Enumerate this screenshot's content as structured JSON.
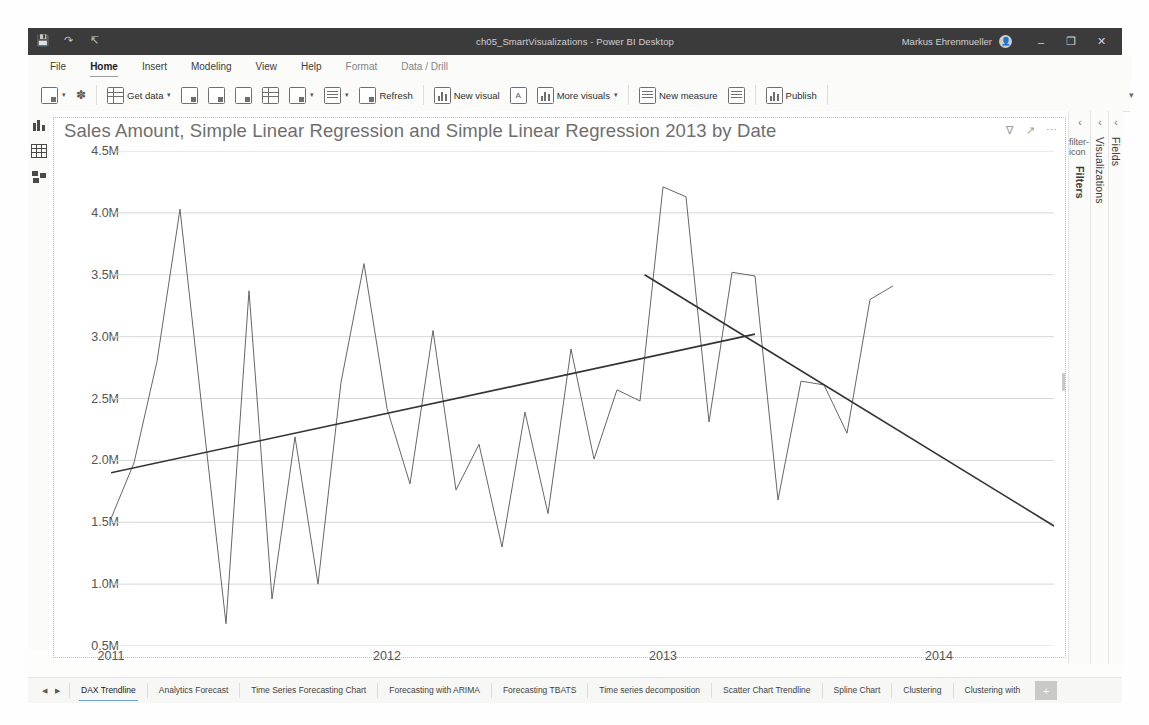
{
  "window": {
    "title": "ch05_SmartVisualizations - Power BI Desktop",
    "user": "Markus Ehrenmueller",
    "avatar_initial": "",
    "quick_access": [
      "save-icon",
      "undo-icon",
      "redo-icon"
    ],
    "controls": {
      "minimize": "–",
      "maximize": "❐",
      "close": "✕"
    }
  },
  "menubar": {
    "items": [
      {
        "label": "File",
        "active": false,
        "dim": false
      },
      {
        "label": "Home",
        "active": true,
        "dim": false
      },
      {
        "label": "Insert",
        "active": false,
        "dim": false
      },
      {
        "label": "Modeling",
        "active": false,
        "dim": false
      },
      {
        "label": "View",
        "active": false,
        "dim": false
      },
      {
        "label": "Help",
        "active": false,
        "dim": false
      },
      {
        "label": "Format",
        "active": false,
        "dim": true
      },
      {
        "label": "Data / Drill",
        "active": false,
        "dim": true
      }
    ]
  },
  "ribbon": {
    "collapse_icon": "chevron-down-icon",
    "items": [
      {
        "label": "",
        "icon": "paste-icon",
        "caret": true
      },
      {
        "label": "",
        "icon": "format-painter-icon",
        "caret": false
      },
      {
        "sep": true
      },
      {
        "label": "Get data",
        "icon": "get-data-icon",
        "caret": true
      },
      {
        "label": "",
        "icon": "excel-workbook-icon",
        "caret": false
      },
      {
        "label": "",
        "icon": "power-bi-datasets-icon",
        "caret": false
      },
      {
        "label": "",
        "icon": "sql-server-icon",
        "caret": false
      },
      {
        "label": "",
        "icon": "enter-data-icon",
        "caret": false
      },
      {
        "label": "",
        "icon": "dataverse-icon",
        "caret": true
      },
      {
        "label": "",
        "icon": "transform-data-icon",
        "caret": true
      },
      {
        "label": "Refresh",
        "icon": "refresh-icon",
        "caret": false
      },
      {
        "sep": true
      },
      {
        "label": "New visual",
        "icon": "new-visual-icon",
        "caret": false
      },
      {
        "label": "",
        "icon": "text-box-icon",
        "caret": false
      },
      {
        "label": "More visuals",
        "icon": "more-visuals-icon",
        "caret": true
      },
      {
        "sep": true
      },
      {
        "label": "New measure",
        "icon": "new-measure-icon",
        "caret": false
      },
      {
        "label": "",
        "icon": "quick-measure-icon",
        "caret": false
      },
      {
        "sep": true
      },
      {
        "label": "Publish",
        "icon": "publish-icon",
        "caret": false
      }
    ]
  },
  "view_strip": {
    "items": [
      {
        "name": "report-view",
        "icon": "report-view-icon"
      },
      {
        "name": "data-view",
        "icon": "data-view-icon"
      },
      {
        "name": "model-view",
        "icon": "model-view-icon"
      }
    ]
  },
  "visual": {
    "title": "Sales Amount, Simple Linear Regression and Simple Linear Regression 2013 by Date",
    "actions": [
      {
        "name": "filter-icon",
        "glyph": "∇"
      },
      {
        "name": "focus-mode-icon",
        "glyph": "↗"
      },
      {
        "name": "more-options-icon",
        "glyph": "⋯"
      }
    ]
  },
  "right_rail": {
    "panels": [
      {
        "title": "Filters",
        "bold": true,
        "chevron": "‹",
        "icon": "filter-icon"
      },
      {
        "title": "Visualizations",
        "bold": false,
        "chevron": "‹",
        "icon": ""
      },
      {
        "title": "Fields",
        "bold": false,
        "chevron": "‹",
        "icon": ""
      }
    ]
  },
  "tabbar": {
    "nav": [
      "◀",
      "▶"
    ],
    "add_label": "+",
    "tabs": [
      {
        "label": "DAX Trendline",
        "active": true
      },
      {
        "label": "Analytics Forecast",
        "active": false
      },
      {
        "label": "Time Series Forecasting Chart",
        "active": false
      },
      {
        "label": "Forecasting with ARIMA",
        "active": false
      },
      {
        "label": "Forecasting TBATS",
        "active": false
      },
      {
        "label": "Time series decomposition",
        "active": false
      },
      {
        "label": "Scatter Chart Trendline",
        "active": false
      },
      {
        "label": "Spline Chart",
        "active": false
      },
      {
        "label": "Clustering",
        "active": false
      },
      {
        "label": "Clustering with",
        "active": false
      }
    ]
  },
  "colors": {
    "accent": "#6f9fd8",
    "titlebar": "#3b3b3b",
    "series_sales": "#666666",
    "series_regression": "#333333",
    "gridline": "#d7d7d7",
    "axis_text": "#545454",
    "title_text": "#6e6e6e"
  },
  "chart_data": {
    "type": "line",
    "title": "Sales Amount, Simple Linear Regression and Simple Linear Regression 2013 by Date",
    "xlabel": "Date",
    "ylabel": "",
    "xtick_labels": [
      "2011",
      "2012",
      "2013",
      "2014"
    ],
    "xtick_positions": [
      0,
      12,
      24,
      36
    ],
    "ytick_labels": [
      "0.5M",
      "1.0M",
      "1.5M",
      "2.0M",
      "2.5M",
      "3.0M",
      "3.5M",
      "4.0M",
      "4.5M"
    ],
    "ytick_values": [
      500000,
      1000000,
      1500000,
      2000000,
      2500000,
      3000000,
      3500000,
      4000000,
      4500000
    ],
    "ylim": [
      500000,
      4500000
    ],
    "xlim": [
      0,
      41
    ],
    "grid": true,
    "legend": "none",
    "series": [
      {
        "name": "Sales Amount",
        "color": "#666666",
        "x": [
          0,
          1,
          2,
          3,
          4,
          5,
          6,
          7,
          8,
          9,
          10,
          11,
          12,
          13,
          14,
          15,
          16,
          17,
          18,
          19,
          20,
          21,
          22,
          23,
          24,
          25,
          26,
          27,
          28,
          29,
          30,
          31,
          32,
          33,
          34
        ],
        "values": [
          1530000,
          1980000,
          2800000,
          4030000,
          2340000,
          680000,
          3370000,
          880000,
          2190000,
          1000000,
          2630000,
          3590000,
          2420000,
          1810000,
          3050000,
          1760000,
          2130000,
          1300000,
          2390000,
          1570000,
          2900000,
          2010000,
          2570000,
          2480000,
          4210000,
          4130000,
          2310000,
          3520000,
          3490000,
          1680000,
          2640000,
          2610000,
          2220000,
          3300000,
          3410000
        ]
      },
      {
        "name": "Simple Linear Regression",
        "color": "#333333",
        "x": [
          0,
          28
        ],
        "values": [
          1900000,
          3020000
        ]
      },
      {
        "name": "Simple Linear Regression 2013",
        "color": "#333333",
        "x": [
          23.2,
          41
        ],
        "values": [
          3500000,
          1470000
        ]
      }
    ]
  }
}
